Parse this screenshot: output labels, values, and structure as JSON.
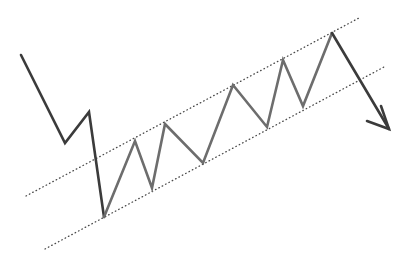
{
  "figure": {
    "background_color": "#ffffff",
    "width": 410,
    "height": 265
  },
  "chart_data": {
    "type": "line",
    "subtitle": "",
    "xlabel": "",
    "ylabel": "",
    "xlim": [
      0,
      410
    ],
    "ylim": [
      265,
      0
    ],
    "grid": false,
    "legend": null,
    "axes_visible": false,
    "tick_labels": [],
    "annotations": [],
    "series": [
      {
        "name": "price-zigzag-lead-in",
        "role": "downtrend-lead-in",
        "type": "line",
        "color": "#3b3b3b",
        "stroke_width": 2.6,
        "points": [
          [
            21,
            55
          ],
          [
            65,
            143
          ],
          [
            89,
            112
          ],
          [
            104,
            217
          ]
        ]
      },
      {
        "name": "price-zigzag-wedge",
        "role": "rising-wedge-oscillation",
        "type": "line",
        "color": "#6d6d6d",
        "stroke_width": 2.6,
        "points": [
          [
            104,
            217
          ],
          [
            135,
            141
          ],
          [
            152,
            188
          ],
          [
            165,
            124
          ],
          [
            203,
            163
          ],
          [
            233,
            85
          ],
          [
            267,
            127
          ],
          [
            283,
            60
          ],
          [
            303,
            106
          ],
          [
            332,
            33
          ]
        ]
      },
      {
        "name": "breakdown-arrow-shaft",
        "role": "breakout-direction",
        "type": "line",
        "color": "#3b3b3b",
        "stroke_width": 2.6,
        "points": [
          [
            332,
            33
          ],
          [
            389,
            129
          ]
        ]
      }
    ],
    "arrow": {
      "name": "breakdown-arrow",
      "direction": "down-right",
      "tip": [
        389,
        129
      ],
      "color": "#3b3b3b",
      "stroke_width": 2.6,
      "head_points": [
        [
          367,
          121
        ],
        [
          389,
          129
        ],
        [
          381,
          106
        ]
      ]
    },
    "trendlines": [
      {
        "name": "upper-resistance-trendline",
        "label": "upper resistance",
        "style": "dotted",
        "color": "#4a4a4a",
        "stroke_width": 1.3,
        "dash": "0.6 3.2",
        "start": [
          26,
          196
        ],
        "end": [
          359,
          18
        ]
      },
      {
        "name": "lower-support-trendline",
        "label": "lower support",
        "style": "dotted",
        "color": "#4a4a4a",
        "stroke_width": 1.3,
        "dash": "0.6 3.2",
        "start": [
          45,
          249
        ],
        "end": [
          384,
          67
        ]
      }
    ]
  }
}
